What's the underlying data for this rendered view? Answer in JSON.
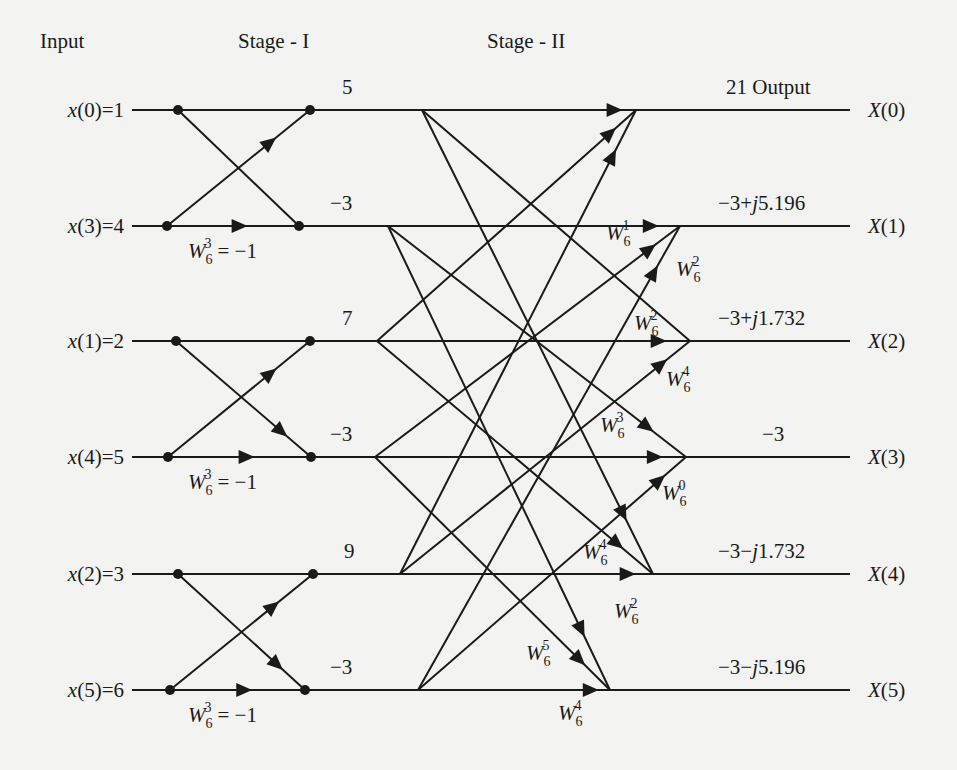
{
  "headers": {
    "input": "Input",
    "stage1": "Stage - I",
    "stage2": "Stage - II"
  },
  "inputs": [
    {
      "label": "x(0)",
      "value": "1"
    },
    {
      "label": "x(3)",
      "value": "4"
    },
    {
      "label": "x(1)",
      "value": "2"
    },
    {
      "label": "x(4)",
      "value": "5"
    },
    {
      "label": "x(2)",
      "value": "3"
    },
    {
      "label": "x(5)",
      "value": "6"
    }
  ],
  "stage1_twiddle": {
    "base": "W",
    "sub": "6",
    "exp": "3",
    "eq": "= −1"
  },
  "stage1_outputs": [
    "5",
    "−3",
    "7",
    "−3",
    "9",
    "−3"
  ],
  "outputs": [
    {
      "label": "X(0)",
      "value": "21 Output"
    },
    {
      "label": "X(1)",
      "value": "−3+j5.196"
    },
    {
      "label": "X(2)",
      "value": "−3+j1.732"
    },
    {
      "label": "X(3)",
      "value": "−3"
    },
    {
      "label": "X(4)",
      "value": "−3−j1.732"
    },
    {
      "label": "X(5)",
      "value": "−3−j5.196"
    }
  ],
  "stage2_twiddles": [
    {
      "exp": "1",
      "target": "X(1)",
      "from": "row1"
    },
    {
      "exp": "2",
      "target": "X(1)",
      "from": "row5"
    },
    {
      "exp": "2",
      "target": "X(2)",
      "from": "row2"
    },
    {
      "exp": "4",
      "target": "X(2)",
      "from": "row4"
    },
    {
      "exp": "3",
      "target": "X(3)",
      "from": "row3"
    },
    {
      "exp": "0",
      "target": "X(3)",
      "from": "row5"
    },
    {
      "exp": "4",
      "target": "X(4)",
      "from": "row2"
    },
    {
      "exp": "2",
      "target": "X(4)",
      "from": "row4"
    },
    {
      "exp": "5",
      "target": "X(5)",
      "from": "row3"
    },
    {
      "exp": "4",
      "target": "X(5)",
      "from": "row5"
    }
  ],
  "twiddle_base": "W",
  "twiddle_sub": "6"
}
